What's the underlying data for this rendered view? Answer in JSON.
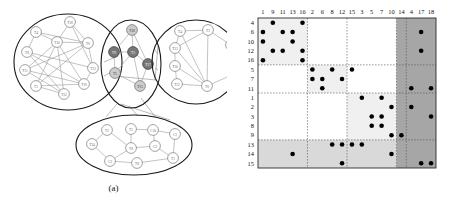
{
  "figure": {
    "panel_a": {
      "caption": "(a)",
      "name": "clustered-graph"
    },
    "panel_b": {
      "caption": "(b)",
      "name": "block-adjacency-matrix"
    }
  },
  "graph": {
    "clusters": [
      {
        "id": "cluster-left",
        "shape": "ellipse",
        "cx": 68,
        "cy": 62,
        "rx": 54,
        "ry": 48,
        "nodes": [
          {
            "label": "T18",
            "x": 70,
            "y": 22
          },
          {
            "label": "T4",
            "x": 36,
            "y": 32
          },
          {
            "label": "T10",
            "x": 57,
            "y": 42
          },
          {
            "label": "T6",
            "x": 88,
            "y": 43
          },
          {
            "label": "T8",
            "x": 27,
            "y": 52
          },
          {
            "label": "T13",
            "x": 93,
            "y": 68
          },
          {
            "label": "T11",
            "x": 25,
            "y": 70
          },
          {
            "label": "T16",
            "x": 84,
            "y": 84
          },
          {
            "label": "T1",
            "x": 36,
            "y": 86
          },
          {
            "label": "T12",
            "x": 64,
            "y": 94
          }
        ],
        "edges": [
          [
            0,
            2
          ],
          [
            0,
            3
          ],
          [
            0,
            5
          ],
          [
            1,
            2
          ],
          [
            1,
            4
          ],
          [
            2,
            3
          ],
          [
            2,
            6
          ],
          [
            2,
            7
          ],
          [
            2,
            8
          ],
          [
            2,
            9
          ],
          [
            3,
            5
          ],
          [
            3,
            6
          ],
          [
            3,
            8
          ],
          [
            4,
            5
          ],
          [
            4,
            9
          ],
          [
            5,
            7
          ],
          [
            6,
            7
          ],
          [
            6,
            9
          ],
          [
            7,
            8
          ],
          [
            8,
            9
          ],
          [
            1,
            3
          ],
          [
            4,
            7
          ]
        ]
      },
      {
        "id": "cluster-middle",
        "shape": "ellipse",
        "cx": 131,
        "cy": 64,
        "rx": 30,
        "ry": 44,
        "nodes": [
          {
            "label": "T18",
            "x": 132,
            "y": 30,
            "shade": "light"
          },
          {
            "label": "T9",
            "x": 114,
            "y": 52,
            "shade": "dark"
          },
          {
            "label": "T3",
            "x": 133,
            "y": 52,
            "shade": "dark"
          },
          {
            "label": "T17",
            "x": 148,
            "y": 64,
            "shade": "dark"
          },
          {
            "label": "T5",
            "x": 115,
            "y": 73,
            "shade": "light"
          },
          {
            "label": "T15",
            "x": 140,
            "y": 86,
            "shade": "light"
          }
        ],
        "edges": [
          [
            0,
            1
          ],
          [
            0,
            2
          ],
          [
            0,
            3
          ],
          [
            1,
            2
          ],
          [
            1,
            4
          ],
          [
            2,
            3
          ],
          [
            2,
            4
          ],
          [
            3,
            5
          ],
          [
            4,
            5
          ],
          [
            2,
            5
          ]
        ]
      },
      {
        "id": "cluster-right",
        "shape": "ellipse",
        "cx": 196,
        "cy": 62,
        "rx": 44,
        "ry": 42,
        "nodes": [
          {
            "label": "T4",
            "x": 180,
            "y": 31
          },
          {
            "label": "T2",
            "x": 208,
            "y": 30
          },
          {
            "label": "T7",
            "x": 231,
            "y": 45
          },
          {
            "label": "T13",
            "x": 175,
            "y": 48
          },
          {
            "label": "T10",
            "x": 175,
            "y": 66
          },
          {
            "label": "T9",
            "x": 234,
            "y": 74
          },
          {
            "label": "T12",
            "x": 177,
            "y": 84
          },
          {
            "label": "T6",
            "x": 207,
            "y": 86
          }
        ],
        "edges": [
          [
            0,
            1
          ],
          [
            0,
            3
          ],
          [
            1,
            2
          ],
          [
            1,
            7
          ],
          [
            3,
            4
          ],
          [
            3,
            1
          ],
          [
            4,
            6
          ],
          [
            4,
            7
          ],
          [
            6,
            7
          ],
          [
            2,
            5
          ],
          [
            5,
            7
          ],
          [
            0,
            7
          ],
          [
            3,
            7
          ]
        ]
      },
      {
        "id": "cluster-bottom",
        "shape": "ellipse",
        "cx": 134,
        "cy": 145,
        "rx": 58,
        "ry": 30,
        "nodes": [
          {
            "label": "T2",
            "x": 107,
            "y": 130
          },
          {
            "label": "T5",
            "x": 131,
            "y": 129
          },
          {
            "label": "C10",
            "x": 153,
            "y": 130
          },
          {
            "label": "C1",
            "x": 175,
            "y": 134
          },
          {
            "label": "T14",
            "x": 92,
            "y": 144
          },
          {
            "label": "T8",
            "x": 131,
            "y": 148
          },
          {
            "label": "C2",
            "x": 155,
            "y": 146
          },
          {
            "label": "C3",
            "x": 110,
            "y": 161
          },
          {
            "label": "T8b",
            "x": 137,
            "y": 163
          },
          {
            "label": "T1",
            "x": 173,
            "y": 158
          }
        ],
        "edges": [
          [
            0,
            4
          ],
          [
            0,
            5
          ],
          [
            1,
            5
          ],
          [
            1,
            2
          ],
          [
            2,
            3
          ],
          [
            2,
            6
          ],
          [
            5,
            6
          ],
          [
            5,
            7
          ],
          [
            7,
            8
          ],
          [
            8,
            9
          ],
          [
            3,
            9
          ],
          [
            6,
            9
          ],
          [
            4,
            7
          ]
        ]
      }
    ],
    "inter_cluster_edges": [
      {
        "from": "cluster-left",
        "to": "cluster-middle"
      },
      {
        "from": "cluster-middle",
        "to": "cluster-right"
      },
      {
        "from": "cluster-middle",
        "to": "cluster-bottom"
      },
      {
        "from": "cluster-left",
        "to": "cluster-right"
      }
    ]
  },
  "matrix": {
    "col_labels": [
      "1",
      "9",
      "11",
      "13",
      "16",
      "2",
      "6",
      "8",
      "12",
      "15",
      "3",
      "5",
      "7",
      "10",
      "14",
      "4",
      "17",
      "18"
    ],
    "row_labels": [
      "4",
      "6",
      "10",
      "12",
      "16",
      "5",
      "7",
      "11",
      "1",
      "2",
      "3",
      "8",
      "9",
      "13",
      "14",
      "15"
    ],
    "row_group_sizes": [
      5,
      3,
      5,
      3
    ],
    "col_group_sizes": [
      5,
      4,
      5,
      1,
      3
    ],
    "shading": {
      "block_light": "#f0f0f0",
      "block_mid": "#d9d9d9",
      "block_dark": "#a6a6a6",
      "dot": "#000000",
      "grid": "#555555"
    },
    "cells": [
      {
        "r": "4",
        "c": "9"
      },
      {
        "r": "4",
        "c": "16"
      },
      {
        "r": "6",
        "c": "1"
      },
      {
        "r": "6",
        "c": "11"
      },
      {
        "r": "6",
        "c": "13"
      },
      {
        "r": "6",
        "c": "17"
      },
      {
        "r": "10",
        "c": "1"
      },
      {
        "r": "10",
        "c": "13"
      },
      {
        "r": "12",
        "c": "9"
      },
      {
        "r": "12",
        "c": "11"
      },
      {
        "r": "12",
        "c": "16"
      },
      {
        "r": "12",
        "c": "17"
      },
      {
        "r": "16",
        "c": "1"
      },
      {
        "r": "16",
        "c": "16"
      },
      {
        "r": "5",
        "c": "2"
      },
      {
        "r": "5",
        "c": "8"
      },
      {
        "r": "5",
        "c": "15"
      },
      {
        "r": "7",
        "c": "2"
      },
      {
        "r": "7",
        "c": "6"
      },
      {
        "r": "7",
        "c": "12"
      },
      {
        "r": "11",
        "c": "6"
      },
      {
        "r": "11",
        "c": "4"
      },
      {
        "r": "11",
        "c": "18"
      },
      {
        "r": "1",
        "c": "3"
      },
      {
        "r": "1",
        "c": "7"
      },
      {
        "r": "2",
        "c": "10"
      },
      {
        "r": "2",
        "c": "4"
      },
      {
        "r": "3",
        "c": "5"
      },
      {
        "r": "3",
        "c": "7"
      },
      {
        "r": "3",
        "c": "18"
      },
      {
        "r": "8",
        "c": "5"
      },
      {
        "r": "8",
        "c": "7"
      },
      {
        "r": "9",
        "c": "10"
      },
      {
        "r": "9",
        "c": "14"
      },
      {
        "r": "13",
        "c": "8"
      },
      {
        "r": "13",
        "c": "12"
      },
      {
        "r": "13",
        "c": "15"
      },
      {
        "r": "13",
        "c": "3"
      },
      {
        "r": "14",
        "c": "13"
      },
      {
        "r": "14",
        "c": "10"
      },
      {
        "r": "15",
        "c": "12"
      },
      {
        "r": "15",
        "c": "17"
      },
      {
        "r": "15",
        "c": "18"
      }
    ]
  }
}
